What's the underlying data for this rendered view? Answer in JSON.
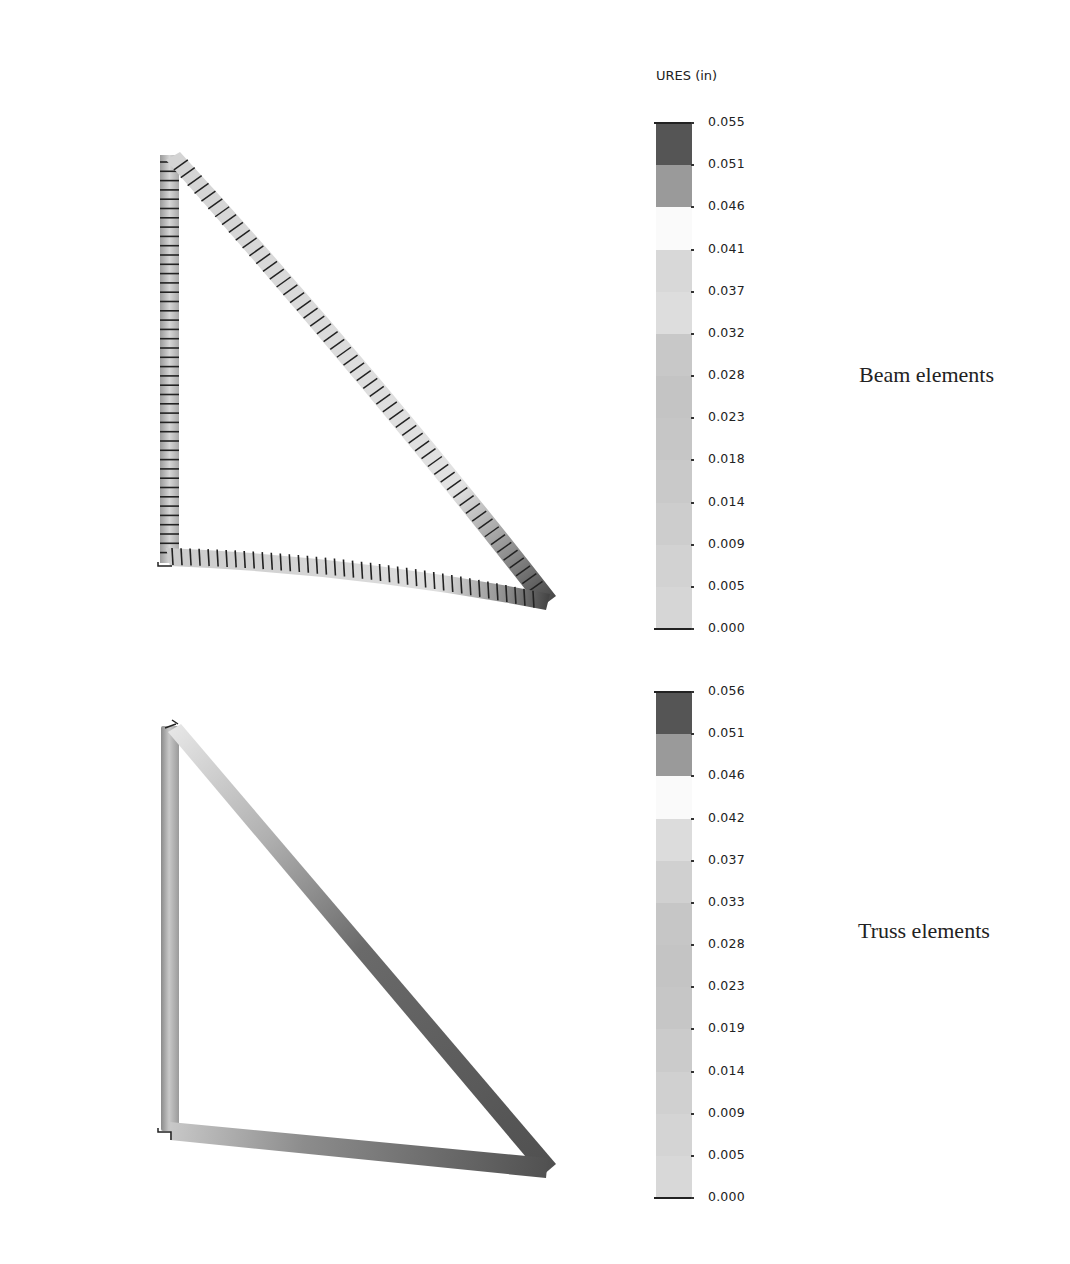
{
  "figure": {
    "legend_title": "URES (in)",
    "panels": [
      {
        "id": "beam",
        "caption": "Beam elements",
        "legend_ticks": [
          "0.055",
          "0.051",
          "0.046",
          "0.041",
          "0.037",
          "0.032",
          "0.028",
          "0.023",
          "0.018",
          "0.014",
          "0.009",
          "0.005",
          "0.000"
        ],
        "legend_bands": [
          "#555555",
          "#9a9a9a",
          "#fafafa",
          "#d8d8d8",
          "#dddddd",
          "#c8c8c8",
          "#c4c4c4",
          "#c6c6c6",
          "#c9c9c9",
          "#cdcdcd",
          "#d2d2d2",
          "#d6d6d6",
          "#c9c9c9"
        ]
      },
      {
        "id": "truss",
        "caption": "Truss elements",
        "legend_ticks": [
          "0.056",
          "0.051",
          "0.046",
          "0.042",
          "0.037",
          "0.033",
          "0.028",
          "0.023",
          "0.019",
          "0.014",
          "0.009",
          "0.005",
          "0.000"
        ],
        "legend_bands": [
          "#555555",
          "#9a9a9a",
          "#fafafa",
          "#dcdcdc",
          "#d0d0d0",
          "#c6c6c6",
          "#c4c4c4",
          "#c6c6c6",
          "#cbcbcb",
          "#d0d0d0",
          "#d4d4d4",
          "#d8d8d8",
          "#c9c9c9"
        ]
      }
    ]
  }
}
